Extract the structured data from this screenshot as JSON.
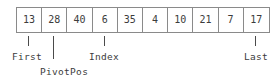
{
  "diagram": {
    "array": {
      "cells": [
        {
          "index": 0,
          "value": "13"
        },
        {
          "index": 1,
          "value": "28"
        },
        {
          "index": 2,
          "value": "40"
        },
        {
          "index": 3,
          "value": "6"
        },
        {
          "index": 4,
          "value": "35"
        },
        {
          "index": 5,
          "value": "4"
        },
        {
          "index": 6,
          "value": "10"
        },
        {
          "index": 7,
          "value": "21"
        },
        {
          "index": 8,
          "value": "7"
        },
        {
          "index": 9,
          "value": "17"
        }
      ]
    },
    "pointers": [
      {
        "name": "first",
        "label": "First",
        "target_cell": 0,
        "tick_x": 28,
        "tick_top": 36,
        "tick_height": 10,
        "label_x": 12,
        "label_y": 52
      },
      {
        "name": "pivotpos",
        "label": "PivotPos",
        "target_cell": 1,
        "tick_x": 53,
        "tick_top": 36,
        "tick_height": 23,
        "label_x": 40,
        "label_y": 67
      },
      {
        "name": "index",
        "label": "Index",
        "target_cell": 3,
        "tick_x": 104,
        "tick_top": 36,
        "tick_height": 10,
        "label_x": 89,
        "label_y": 52
      },
      {
        "name": "last",
        "label": "Last",
        "target_cell": 9,
        "tick_x": 255,
        "tick_top": 36,
        "tick_height": 10,
        "label_x": 244,
        "label_y": 52
      }
    ],
    "colors": {
      "border": "#8a8a8a",
      "text": "#3c3c3c",
      "tick": "#4a4a4a",
      "background": "#ffffff"
    }
  }
}
